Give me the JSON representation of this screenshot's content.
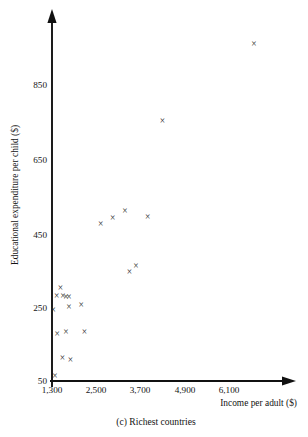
{
  "caption": "(c)  Richest countries",
  "chart_data": {
    "type": "scatter",
    "title": "",
    "subtitle": "",
    "xlabel": "Income per adult ($)",
    "ylabel": "Educational expenditure per child ($)",
    "xlim": [
      1300,
      6700
    ],
    "ylim": [
      50,
      1000
    ],
    "xticks": [
      1300,
      2500,
      3700,
      4900,
      6100
    ],
    "xticklabels": [
      "1,300",
      "2,500",
      "3,700",
      "4,900",
      "6,100"
    ],
    "yticks": [
      50,
      250,
      450,
      650,
      850
    ],
    "yticklabels": [
      "50",
      "250",
      "450",
      "650",
      "850"
    ],
    "grid": false,
    "legend": false,
    "marker": "x",
    "series": [
      {
        "name": "Richest countries",
        "points": [
          {
            "x": 1330,
            "y": 240
          },
          {
            "x": 1430,
            "y": 280
          },
          {
            "x": 1530,
            "y": 300
          },
          {
            "x": 1600,
            "y": 280
          },
          {
            "x": 1680,
            "y": 275
          },
          {
            "x": 1760,
            "y": 275
          },
          {
            "x": 1760,
            "y": 250
          },
          {
            "x": 2090,
            "y": 255
          },
          {
            "x": 1440,
            "y": 175
          },
          {
            "x": 1680,
            "y": 180
          },
          {
            "x": 1580,
            "y": 110
          },
          {
            "x": 1800,
            "y": 105
          },
          {
            "x": 1380,
            "y": 62
          },
          {
            "x": 2180,
            "y": 180
          },
          {
            "x": 2620,
            "y": 475
          },
          {
            "x": 2950,
            "y": 490
          },
          {
            "x": 3280,
            "y": 510
          },
          {
            "x": 3900,
            "y": 495
          },
          {
            "x": 3400,
            "y": 345
          },
          {
            "x": 3580,
            "y": 360
          },
          {
            "x": 4300,
            "y": 755
          },
          {
            "x": 6780,
            "y": 965
          }
        ]
      }
    ]
  },
  "geometry": {
    "x_axis_y_px": 381,
    "y_axis_x_px": 52,
    "x_origin_px": 52,
    "x_unit_px_per_1200": 44.2,
    "y_origin_px": 381,
    "y_unit_px_per_200": 73.5
  }
}
